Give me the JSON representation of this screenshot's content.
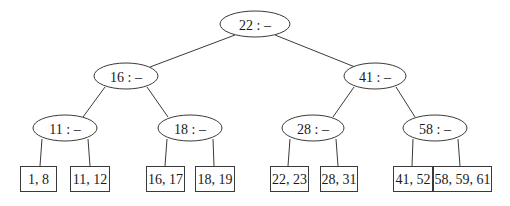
{
  "diagram": {
    "type": "tree",
    "internal_nodes": [
      {
        "id": "n22",
        "label": "22 : –",
        "cx": 255,
        "cy": 24,
        "rx": 35,
        "ry": 13
      },
      {
        "id": "n16",
        "label": "16 : –",
        "cx": 126,
        "cy": 76,
        "rx": 32,
        "ry": 13
      },
      {
        "id": "n41",
        "label": "41 : –",
        "cx": 375,
        "cy": 76,
        "rx": 31,
        "ry": 13
      },
      {
        "id": "n11",
        "label": "11 : –",
        "cx": 65,
        "cy": 128,
        "rx": 32,
        "ry": 13
      },
      {
        "id": "n18",
        "label": "18 : –",
        "cx": 190,
        "cy": 128,
        "rx": 32,
        "ry": 13
      },
      {
        "id": "n28",
        "label": "28 : –",
        "cx": 313,
        "cy": 128,
        "rx": 31,
        "ry": 13
      },
      {
        "id": "n58",
        "label": "58 : –",
        "cx": 435,
        "cy": 128,
        "rx": 32,
        "ry": 13
      }
    ],
    "leaves": [
      {
        "id": "l1",
        "label": "1, 8",
        "x": 20,
        "y": 166,
        "w": 36,
        "h": 25
      },
      {
        "id": "l2",
        "label": "11, 12",
        "x": 70,
        "y": 166,
        "w": 39,
        "h": 25
      },
      {
        "id": "l3",
        "label": "16, 17",
        "x": 146,
        "y": 166,
        "w": 38,
        "h": 25
      },
      {
        "id": "l4",
        "label": "18, 19",
        "x": 195,
        "y": 166,
        "w": 39,
        "h": 25
      },
      {
        "id": "l5",
        "label": "22, 23",
        "x": 270,
        "y": 166,
        "w": 38,
        "h": 25
      },
      {
        "id": "l6",
        "label": "28, 31",
        "x": 320,
        "y": 166,
        "w": 37,
        "h": 25
      },
      {
        "id": "l7",
        "label": "41, 52",
        "x": 393,
        "y": 166,
        "w": 39,
        "h": 25
      },
      {
        "id": "l8",
        "label": "58, 59, 61",
        "x": 433,
        "y": 166,
        "w": 58,
        "h": 25
      }
    ],
    "edges": [
      {
        "from": "n22",
        "to": "n16",
        "x1": 235,
        "y1": 35,
        "x2": 150,
        "y2": 67
      },
      {
        "from": "n22",
        "to": "n41",
        "x1": 275,
        "y1": 35,
        "x2": 355,
        "y2": 67
      },
      {
        "from": "n16",
        "to": "n11",
        "x1": 105,
        "y1": 87,
        "x2": 83,
        "y2": 117
      },
      {
        "from": "n16",
        "to": "n18",
        "x1": 147,
        "y1": 87,
        "x2": 168,
        "y2": 117
      },
      {
        "from": "n41",
        "to": "n28",
        "x1": 354,
        "y1": 87,
        "x2": 333,
        "y2": 117
      },
      {
        "from": "n41",
        "to": "n58",
        "x1": 396,
        "y1": 87,
        "x2": 415,
        "y2": 117
      },
      {
        "from": "n11",
        "to": "l1",
        "x1": 42,
        "y1": 139,
        "x2": 40,
        "y2": 166
      },
      {
        "from": "n11",
        "to": "l2",
        "x1": 88,
        "y1": 139,
        "x2": 90,
        "y2": 166
      },
      {
        "from": "n18",
        "to": "l3",
        "x1": 167,
        "y1": 139,
        "x2": 165,
        "y2": 166
      },
      {
        "from": "n18",
        "to": "l4",
        "x1": 213,
        "y1": 139,
        "x2": 214,
        "y2": 166
      },
      {
        "from": "n28",
        "to": "l5",
        "x1": 290,
        "y1": 139,
        "x2": 288,
        "y2": 166
      },
      {
        "from": "n28",
        "to": "l6",
        "x1": 336,
        "y1": 139,
        "x2": 338,
        "y2": 166
      },
      {
        "from": "n58",
        "to": "l7",
        "x1": 413,
        "y1": 139,
        "x2": 412,
        "y2": 166
      },
      {
        "from": "n58",
        "to": "l8",
        "x1": 458,
        "y1": 139,
        "x2": 460,
        "y2": 166
      }
    ]
  }
}
